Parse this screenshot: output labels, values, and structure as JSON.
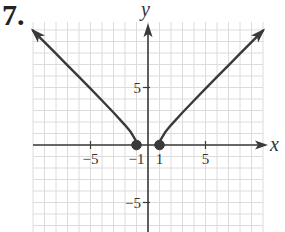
{
  "problem": {
    "number": "7."
  },
  "chart_data": {
    "type": "line",
    "title": "",
    "xlabel": "x",
    "ylabel": "y",
    "xlim": [
      -10,
      10
    ],
    "ylim": [
      -8,
      10
    ],
    "grid": true,
    "x_ticks": [
      {
        "value": -5,
        "label": "−5"
      },
      {
        "value": -1,
        "label": "−1"
      },
      {
        "value": 1,
        "label": "1"
      },
      {
        "value": 5,
        "label": "5"
      }
    ],
    "y_ticks": [
      {
        "value": 5,
        "label": "5"
      },
      {
        "value": -5,
        "label": "−5"
      }
    ],
    "series": [
      {
        "name": "left branch",
        "description": "y = sqrt(x^2 - 1), x <= -1",
        "x": [
          -1,
          -1.1,
          -1.5,
          -2,
          -3,
          -4,
          -5,
          -6,
          -7,
          -8,
          -9,
          -10
        ],
        "y": [
          0,
          0.46,
          1.12,
          1.73,
          2.83,
          3.87,
          4.9,
          5.92,
          6.93,
          7.94,
          8.94,
          9.95
        ],
        "endpoint_closed": true,
        "arrow_end": true
      },
      {
        "name": "right branch",
        "description": "y = sqrt(x^2 - 1), x >= 1",
        "x": [
          1,
          1.1,
          1.5,
          2,
          3,
          4,
          5,
          6,
          7,
          8,
          9,
          10
        ],
        "y": [
          0,
          0.46,
          1.12,
          1.73,
          2.83,
          3.87,
          4.9,
          5.92,
          6.93,
          7.94,
          8.94,
          9.95
        ],
        "endpoint_closed": true,
        "arrow_end": true
      }
    ],
    "points": [
      {
        "x": -1,
        "y": 0,
        "style": "closed"
      },
      {
        "x": 1,
        "y": 0,
        "style": "closed"
      }
    ]
  },
  "colors": {
    "grid": "#dcdcdc",
    "axis": "#3a3a3a",
    "curve": "#3a3a3a"
  }
}
